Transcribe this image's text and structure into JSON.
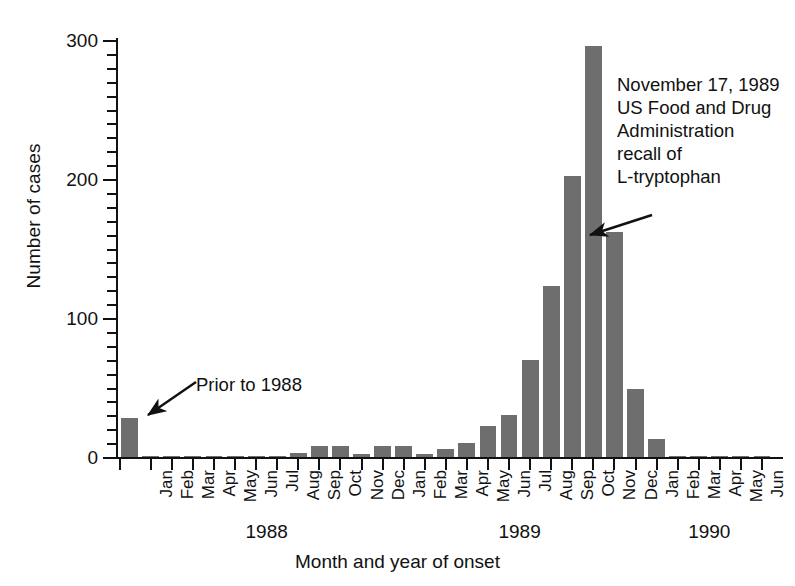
{
  "chart_data": {
    "type": "bar",
    "title": "",
    "xlabel": "Month and year of onset",
    "ylabel": "Number of cases",
    "ylim": [
      0,
      300
    ],
    "yticks": [
      0,
      100,
      200,
      300
    ],
    "ytick_labels": [
      "0",
      "100",
      "200",
      "300"
    ],
    "minor_tick_step": 10,
    "grid": false,
    "legend": null,
    "bar_color": "#6e6e6e",
    "axis_color": "#111111",
    "categories": [
      "Prior to 1988",
      "Jan",
      "Feb",
      "Mar",
      "Apr",
      "May",
      "Jun",
      "Jul",
      "Aug",
      "Sep",
      "Oct",
      "Nov",
      "Dec",
      "Jan",
      "Feb",
      "Mar",
      "Apr",
      "May",
      "Jun",
      "Jul",
      "Aug",
      "Sep",
      "Oct",
      "Nov",
      "Dec",
      "Jan",
      "Feb",
      "Mar",
      "Apr",
      "May",
      "Jun"
    ],
    "values": [
      28,
      1,
      1,
      1,
      1,
      1,
      1,
      1,
      3,
      8,
      8,
      2,
      8,
      8,
      2,
      6,
      10,
      22,
      30,
      70,
      123,
      202,
      296,
      162,
      49,
      13,
      1,
      1,
      1,
      1,
      1
    ],
    "year_groups": [
      {
        "year": "1988",
        "start_index": 1,
        "end_index": 12
      },
      {
        "year": "1989",
        "start_index": 13,
        "end_index": 24
      },
      {
        "year": "1990",
        "start_index": 25,
        "end_index": 30
      }
    ],
    "annotations": [
      {
        "name": "fda-recall",
        "text": "November 17, 1989\nUS Food and Drug\nAdministration\nrecall of\nL-tryptophan",
        "points_to_category": "Nov",
        "points_to_year": "1989"
      },
      {
        "name": "prior-to-1988",
        "text": "Prior to 1988",
        "points_to_category": "Prior to 1988",
        "points_to_year": ""
      }
    ]
  },
  "axis": {
    "y_title": "Number of cases",
    "x_title": "Month and year of onset"
  },
  "annotation_fda": {
    "line1": "November 17, 1989",
    "line2": "US Food and Drug",
    "line3": "Administration",
    "line4": "recall of",
    "line5": "L-tryptophan",
    "full": "November 17, 1989\nUS Food and Drug\nAdministration\nrecall of\nL-tryptophan"
  },
  "annotation_prior": {
    "text": "Prior to 1988"
  }
}
